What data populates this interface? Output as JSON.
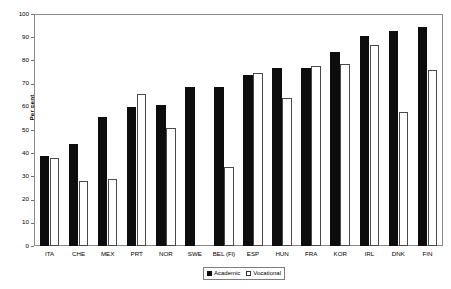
{
  "chart_data": {
    "type": "bar",
    "title": "",
    "subtitle": "",
    "xlabel": "",
    "ylabel": "Per cent",
    "ylim": [
      0,
      100
    ],
    "ytick_step": 10,
    "yticks": [
      0,
      10,
      20,
      30,
      40,
      50,
      60,
      70,
      80,
      90,
      100
    ],
    "grid": false,
    "legend_position": "bottom-right",
    "categories": [
      "ITA",
      "CHE",
      "MEX",
      "PRT",
      "NOR",
      "SWE",
      "BEL (Fl)",
      "ESP",
      "HUN",
      "FRA",
      "KOR",
      "IRL",
      "DNK",
      "FIN"
    ],
    "series": [
      {
        "name": "Academic",
        "color": "#0d0d0d",
        "values": [
          39,
          44,
          56,
          60,
          61,
          69,
          69,
          74,
          77,
          77,
          84,
          91,
          93,
          95
        ]
      },
      {
        "name": "Vocational",
        "color": "#ffffff",
        "values": [
          38,
          28,
          29,
          66,
          51,
          null,
          34,
          75,
          64,
          78,
          79,
          87,
          58,
          76
        ]
      }
    ]
  },
  "axis": {
    "y_label": "Per cent",
    "y_tick_labels": [
      "0",
      "10",
      "20",
      "30",
      "40",
      "50",
      "60",
      "70",
      "80",
      "90",
      "100"
    ]
  },
  "legend": {
    "items": [
      {
        "label": "Academic",
        "swatch": "filled-square-icon"
      },
      {
        "label": "Vocational",
        "swatch": "open-square-icon"
      }
    ]
  }
}
